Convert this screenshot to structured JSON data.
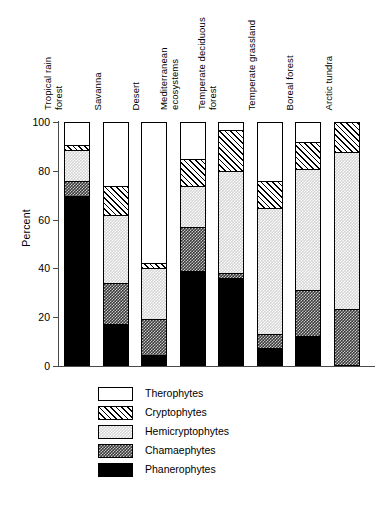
{
  "chart_data": {
    "type": "bar",
    "subtype": "stacked-percentage",
    "title": "",
    "xlabel": "",
    "ylabel": "Percent",
    "ylim": [
      0,
      100
    ],
    "yticks": [
      0,
      20,
      40,
      60,
      80,
      100
    ],
    "ytick_labels": [
      "0",
      "20",
      "40",
      "60",
      "80",
      "100"
    ],
    "grid": false,
    "legend_position": "bottom-left",
    "categories": [
      "Tropical rain forest",
      "Savanna",
      "Desert",
      "Mediterranean ecosystems",
      "Temperate deciduous forest",
      "Temperate grassland",
      "Boreal forest",
      "Arctic tundra"
    ],
    "category_lines": [
      [
        "Tropical rain",
        "forest"
      ],
      [
        "Savanna"
      ],
      [
        "Desert"
      ],
      [
        "Mediterranean",
        "ecosystems"
      ],
      [
        "Temperate deciduous",
        "forest"
      ],
      [
        "Temperate grassland"
      ],
      [
        "Boreal forest"
      ],
      [
        "Arctic tundra"
      ]
    ],
    "stack_order_bottom_to_top": [
      "Phanerophytes",
      "Chamaephytes",
      "Hemicryptophytes",
      "Cryptophytes",
      "Therophytes"
    ],
    "series": [
      {
        "name": "Phanerophytes",
        "fill": "solid-black",
        "values": [
          70,
          17,
          4,
          39,
          36,
          7,
          12,
          0
        ]
      },
      {
        "name": "Chamaephytes",
        "fill": "dark-stipple",
        "values": [
          6,
          17,
          15,
          18,
          2,
          6,
          19,
          23
        ]
      },
      {
        "name": "Hemicryptophytes",
        "fill": "light-stipple",
        "values": [
          13,
          28,
          21,
          17,
          42,
          52,
          50,
          65
        ]
      },
      {
        "name": "Cryptophytes",
        "fill": "diagonal-hatch",
        "values": [
          2,
          12,
          2,
          11,
          17,
          11,
          11,
          12
        ]
      },
      {
        "name": "Therophytes",
        "fill": "white",
        "values": [
          9,
          26,
          58,
          15,
          3,
          24,
          8,
          0
        ]
      }
    ],
    "cumulative_tops": [
      [
        70,
        76,
        89,
        91,
        100
      ],
      [
        17,
        34,
        62,
        74,
        100
      ],
      [
        4,
        19,
        40,
        42,
        100
      ],
      [
        39,
        57,
        74,
        85,
        100
      ],
      [
        36,
        38,
        80,
        97,
        100
      ],
      [
        7,
        13,
        65,
        76,
        100
      ],
      [
        12,
        31,
        81,
        92,
        100
      ],
      [
        0,
        23,
        88,
        100,
        100
      ]
    ]
  },
  "legend": {
    "items": [
      {
        "label": "Therophytes",
        "fill": "white"
      },
      {
        "label": "Cryptophytes",
        "fill": "diagonal-hatch"
      },
      {
        "label": "Hemicryptophytes",
        "fill": "light-stipple"
      },
      {
        "label": "Chamaephytes",
        "fill": "dark-stipple"
      },
      {
        "label": "Phanerophytes",
        "fill": "solid-black"
      }
    ]
  },
  "colors": {
    "axis": "#4a4a4a",
    "outline": "#000000",
    "white_fill": "#ffffff",
    "light_stipple": "#d4d4d4",
    "dark_stipple": "#3a3a3a",
    "solid_black": "#000000",
    "background": "#ffffff"
  }
}
